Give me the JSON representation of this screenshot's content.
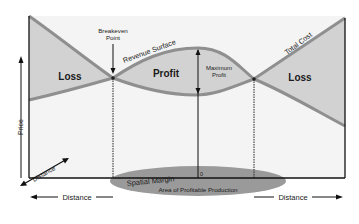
{
  "diagram": {
    "regions": {
      "loss_left": "Loss",
      "profit": "Profit",
      "loss_right": "Loss"
    },
    "curves": {
      "revenue": "Revenue Surface",
      "cost": "Total Cost"
    },
    "annotations": {
      "breakeven_line1": "Breakeven",
      "breakeven_line2": "Point",
      "max_profit_line1": "Maximum",
      "max_profit_line2": "Profit",
      "spatial_margin": "Spatial Margin",
      "area_profitable": "Area of Profitable Production",
      "origin": "0"
    },
    "axes": {
      "y": "Price",
      "z": "Distance",
      "x_left": "Distance",
      "x_right": "Distance"
    },
    "colors": {
      "region_fill": "#d2d2d2",
      "curve": "#8f8f8f",
      "background_plane": "#f4f4f4",
      "ellipse": "#9a9a9a",
      "axis": "#111111"
    }
  }
}
